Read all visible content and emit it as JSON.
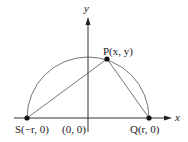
{
  "diagram": {
    "colors": {
      "line": "#555555",
      "axis": "#333333",
      "dot": "#111111"
    },
    "axes": {
      "x_label": "x",
      "y_label": "y",
      "origin_label": "(0, 0)"
    },
    "points": {
      "P": {
        "name": "P",
        "label": "P(x, y)"
      },
      "S": {
        "name": "S",
        "label": "S(−r, 0)"
      },
      "Q": {
        "name": "Q",
        "label": "Q(r, 0)"
      }
    },
    "shapes": [
      "semicircle centered at origin, radius r",
      "segment S–P",
      "segment P–Q"
    ]
  }
}
